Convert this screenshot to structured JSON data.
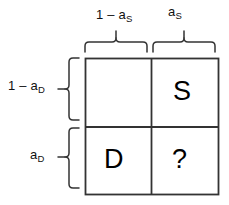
{
  "figure": {
    "type": "2x2-contingency-diagram",
    "background_color": "#ffffff",
    "line_color": "#333333",
    "text_color": "#111111"
  },
  "column_labels": [
    {
      "base": "1 – a",
      "sub": "S",
      "name": "column-label-left"
    },
    {
      "base": "a",
      "sub": "S",
      "name": "column-label-right"
    }
  ],
  "row_labels": [
    {
      "base": "1 – a",
      "sub": "D",
      "name": "row-label-top"
    },
    {
      "base": "a",
      "sub": "D",
      "name": "row-label-bottom"
    }
  ],
  "grid": {
    "rows": 2,
    "columns": 2,
    "cells": [
      [
        {
          "text": "",
          "name": "cell-top-left"
        },
        {
          "text": "S",
          "name": "cell-top-right"
        }
      ],
      [
        {
          "text": "D",
          "name": "cell-bottom-left"
        },
        {
          "text": "?",
          "name": "cell-bottom-right"
        }
      ]
    ]
  }
}
